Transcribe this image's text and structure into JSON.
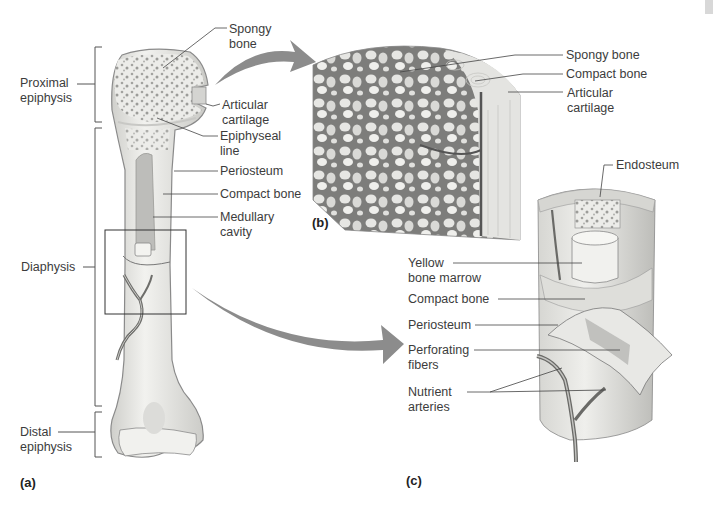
{
  "figure": {
    "panels": [
      {
        "id": "a",
        "label": "(a)"
      },
      {
        "id": "b",
        "label": "(b)"
      },
      {
        "id": "c",
        "label": "(c)"
      }
    ],
    "panel_a": {
      "region_labels": {
        "proximal_epiphysis": "Proximal\nepiphysis",
        "diaphysis": "Diaphysis",
        "distal_epiphysis": "Distal\nepiphysis"
      },
      "structure_labels": {
        "spongy_bone": "Spongy\nbone",
        "articular_cartilage": "Articular\ncartilage",
        "epiphyseal_line": "Epiphyseal\nline",
        "periosteum": "Periosteum",
        "compact_bone": "Compact bone",
        "medullary_cavity": "Medullary\ncavity"
      }
    },
    "panel_b": {
      "structure_labels": {
        "spongy_bone": "Spongy bone",
        "compact_bone": "Compact bone",
        "articular_cartilage": "Articular\ncartilage"
      }
    },
    "panel_c": {
      "structure_labels": {
        "endosteum": "Endosteum",
        "yellow_bone_marrow": "Yellow\nbone marrow",
        "compact_bone": "Compact bone",
        "periosteum": "Periosteum",
        "perforating_fibers": "Perforating\nfibers",
        "nutrient_arteries": "Nutrient\narteries"
      }
    },
    "colors": {
      "bone_fill": "#e9e9e6",
      "bone_outline": "#8a8a8a",
      "spongy_dot": "#9a9a9a",
      "arrow": "#8c8c8c",
      "leader_line": "#444444"
    }
  }
}
